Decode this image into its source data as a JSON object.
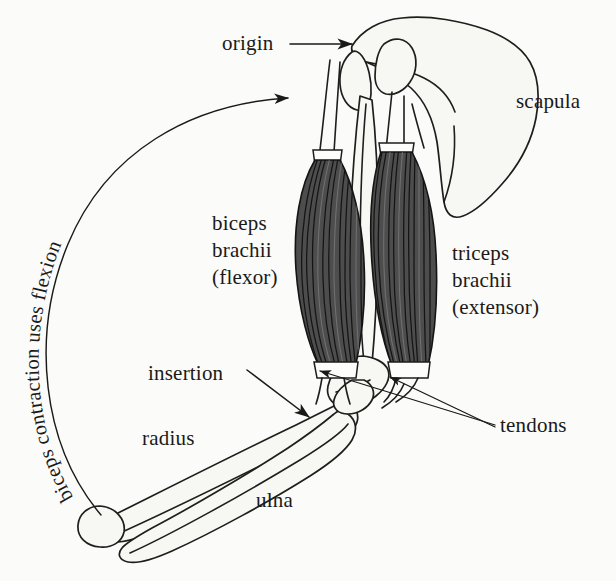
{
  "figure": {
    "background_color": "#fbfbf9",
    "ink_color": "#1a1a18",
    "muscle_color": "#4d4d4d",
    "bone_color": "#f7f7f4"
  },
  "labels": {
    "origin": "origin",
    "scapula": "scapula",
    "biceps": "biceps\nbrachii\n(flexor)",
    "triceps": "triceps\nbrachii\n(extensor)",
    "insertion": "insertion",
    "radius": "radius",
    "ulna": "ulna",
    "tendons": "tendons"
  },
  "arc_label": {
    "full_text": "biceps contraction uses flexion",
    "segments": [
      "biceps",
      "contraction",
      "uses",
      "flexion"
    ],
    "direction": "counterclockwise-upward",
    "has_arrowhead": true
  },
  "structures": [
    {
      "name": "scapula",
      "kind": "bone"
    },
    {
      "name": "humerus",
      "kind": "bone"
    },
    {
      "name": "radius",
      "kind": "bone"
    },
    {
      "name": "ulna",
      "kind": "bone"
    },
    {
      "name": "biceps brachii",
      "kind": "muscle",
      "role": "flexor"
    },
    {
      "name": "triceps brachii",
      "kind": "muscle",
      "role": "extensor"
    },
    {
      "name": "tendons",
      "kind": "connective",
      "count": 2
    }
  ],
  "annotations": {
    "origin_arrow": "straight horizontal arrow pointing right to shoulder joint",
    "insertion_arrow": "diagonal arrow pointing down-right to radius tuberosity",
    "tendon_arrows": "two leader lines from the word tendons to biceps and triceps tendons"
  }
}
